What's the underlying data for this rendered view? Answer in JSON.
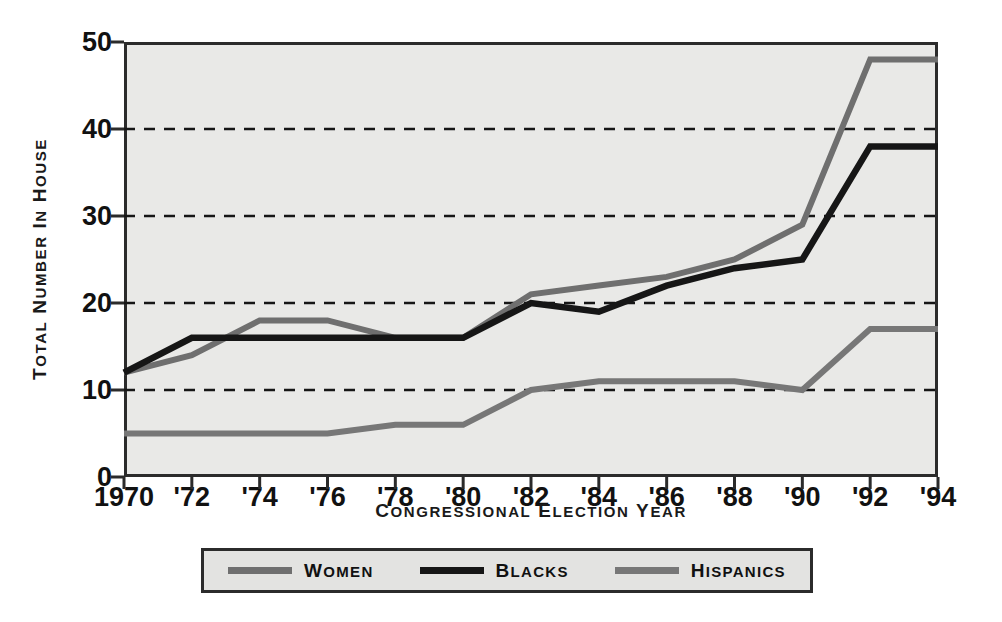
{
  "chart_data": {
    "type": "line",
    "title": "",
    "xlabel": "Congressional Election Year",
    "ylabel": "Total Number in House",
    "x": [
      1970,
      1972,
      1974,
      1976,
      1978,
      1980,
      1982,
      1984,
      1986,
      1988,
      1990,
      1992,
      1994
    ],
    "categories": [
      "1970",
      "'72",
      "'74",
      "'76",
      "'78",
      "'80",
      "'82",
      "'84",
      "'86",
      "'88",
      "'90",
      "'92",
      "'94"
    ],
    "series": [
      {
        "name": "Women",
        "color": "#6f6f6f",
        "values": [
          12,
          14,
          18,
          18,
          16,
          16,
          21,
          22,
          23,
          25,
          29,
          48,
          48
        ]
      },
      {
        "name": "Blacks",
        "color": "#161616",
        "values": [
          12,
          16,
          16,
          16,
          16,
          16,
          20,
          19,
          22,
          24,
          25,
          38,
          38
        ]
      },
      {
        "name": "Hispanics",
        "color": "#777777",
        "values": [
          5,
          5,
          5,
          5,
          6,
          6,
          10,
          11,
          11,
          11,
          10,
          17,
          17
        ]
      }
    ],
    "ylim": [
      0,
      50
    ],
    "yticks": [
      0,
      10,
      20,
      30,
      40,
      50
    ],
    "ytick_labels": [
      "0",
      "10",
      "20",
      "30",
      "40",
      "50"
    ],
    "xlim": [
      1970,
      1994
    ],
    "grid": "horizontal-dashed",
    "legend_position": "bottom",
    "plot_background": "#e9e9e7"
  },
  "legend": {
    "items": [
      {
        "label": "Women",
        "color": "#6f6f6f"
      },
      {
        "label": "Blacks",
        "color": "#161616"
      },
      {
        "label": "Hispanics",
        "color": "#777777"
      }
    ]
  },
  "axis_titles": {
    "y": "Total Number in House",
    "x": "Congressional Election Year"
  }
}
